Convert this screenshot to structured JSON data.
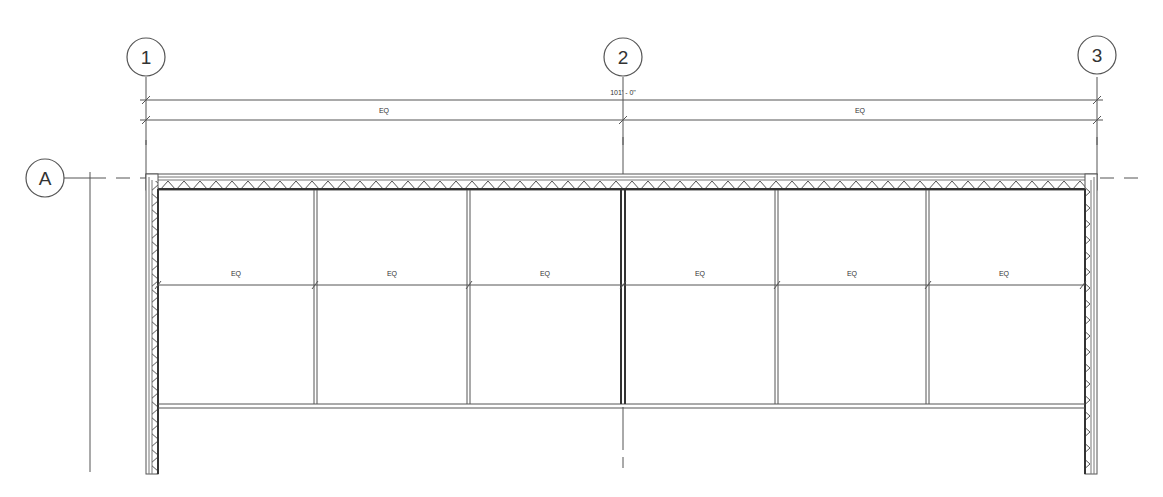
{
  "drawing": {
    "type": "architectural floor plan - curtain wall elevation/plan",
    "line_color": "#555555",
    "wall_color": "#666666",
    "grid_bubbles": [
      {
        "id": "1",
        "label": "1",
        "x": 146,
        "y": 57
      },
      {
        "id": "2",
        "label": "2",
        "x": 623,
        "y": 57
      },
      {
        "id": "3",
        "label": "3",
        "x": 1100,
        "y": 57
      },
      {
        "id": "A",
        "label": "A",
        "x": 45,
        "y": 178
      }
    ],
    "overall_dimension": {
      "label": "101' - 0\"",
      "y": 100,
      "x1": 146,
      "x2": 1097
    },
    "eq_dimension_top": {
      "y": 120,
      "segments": [
        {
          "label": "EQ",
          "x1": 146,
          "x2": 623
        },
        {
          "label": "EQ",
          "x1": 623,
          "x2": 1097
        }
      ]
    },
    "eq_dimension_panels": {
      "y": 285,
      "segments": [
        {
          "label": "EQ",
          "x1": 158,
          "x2": 314
        },
        {
          "label": "EQ",
          "x1": 314,
          "x2": 469
        },
        {
          "label": "EQ",
          "x1": 469,
          "x2": 623
        },
        {
          "label": "EQ",
          "x1": 623,
          "x2": 777
        },
        {
          "label": "EQ",
          "x1": 777,
          "x2": 928
        },
        {
          "label": "EQ",
          "x1": 928,
          "x2": 1082
        }
      ]
    },
    "panel_mullions_x": [
      158,
      314,
      469,
      623,
      777,
      928,
      1082
    ],
    "panel_top_y": 190,
    "panel_bottom_y": 407
  }
}
